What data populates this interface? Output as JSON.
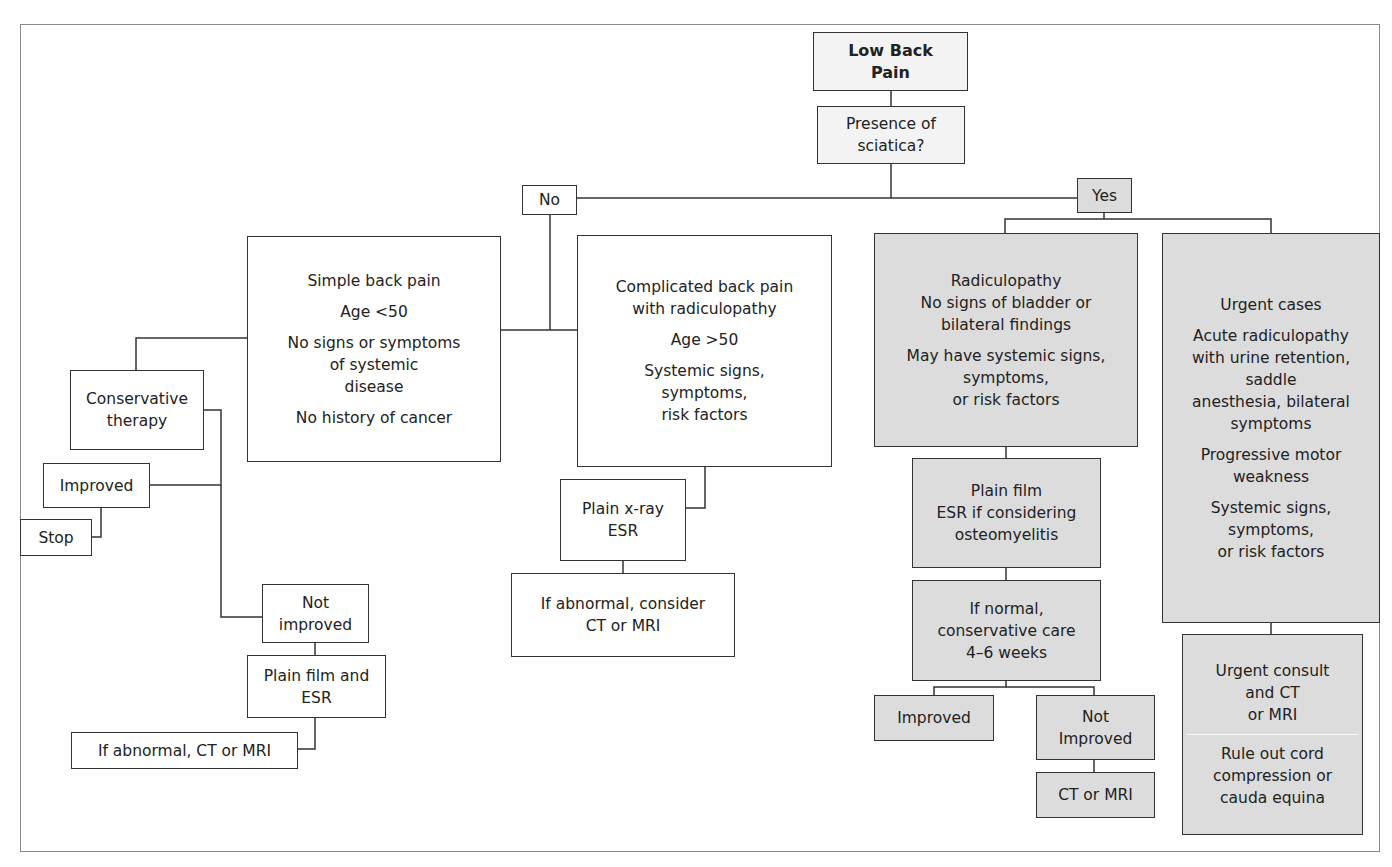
{
  "diagram": {
    "title": "Low Back Pain",
    "colors": {
      "outcome_gray": "#dcdcdc",
      "header_fill": "#f3f3f3",
      "line": "#333333",
      "frame": "#8a8a8a"
    },
    "nodes": {
      "root": {
        "lines": [
          "Low Back",
          "Pain"
        ]
      },
      "question": {
        "lines": [
          "Presence of",
          "sciatica?"
        ]
      },
      "no": {
        "label": "No"
      },
      "yes": {
        "label": "Yes"
      },
      "simple": {
        "title": "Simple back pain",
        "age": "Age <50",
        "criteria": [
          "No signs or symptoms",
          "of systemic",
          "disease"
        ],
        "history": "No history of cancer"
      },
      "conservative": {
        "lines": [
          "Conservative",
          "therapy"
        ]
      },
      "improved_left": {
        "label": "Improved"
      },
      "stop": {
        "label": "Stop"
      },
      "not_improved_left": {
        "lines": [
          "Not",
          "improved"
        ]
      },
      "plain_film_esr": {
        "lines": [
          "Plain film and",
          "ESR"
        ]
      },
      "if_abnormal_left": {
        "label": "If abnormal, CT or MRI"
      },
      "complicated": {
        "title": [
          "Complicated back pain",
          "with radiculopathy"
        ],
        "age": "Age >50",
        "criteria": [
          "Systemic signs,",
          "symptoms,",
          "risk factors"
        ]
      },
      "plain_xray": {
        "lines": [
          "Plain x-ray",
          "ESR"
        ]
      },
      "if_abnormal_consider": {
        "lines": [
          "If abnormal, consider",
          "CT or MRI"
        ]
      },
      "radiculopathy": {
        "title": [
          "Radiculopathy",
          "No signs of bladder or",
          "bilateral findings"
        ],
        "note": [
          "May have systemic signs,",
          "symptoms,",
          "or risk factors"
        ]
      },
      "plain_film_osteo": {
        "lines": [
          "Plain film",
          "ESR if considering",
          "osteomyelitis"
        ]
      },
      "if_normal": {
        "lines": [
          "If normal,",
          "conservative care",
          "4–6 weeks"
        ]
      },
      "improved_right": {
        "label": "Improved"
      },
      "not_improved_right": {
        "lines": [
          "Not",
          "Improved"
        ]
      },
      "ct_mri": {
        "label": "CT or MRI"
      },
      "urgent": {
        "title": "Urgent cases",
        "acute": [
          "Acute radiculopathy",
          "with urine retention,",
          "saddle",
          "anesthesia, bilateral",
          "symptoms"
        ],
        "motor": [
          "Progressive motor",
          "weakness"
        ],
        "systemic": [
          "Systemic signs,",
          "symptoms,",
          "or risk factors"
        ]
      },
      "urgent_consult": {
        "consult": [
          "Urgent consult",
          "and CT",
          "or MRI"
        ],
        "rule_out": [
          "Rule out cord",
          "compression or",
          "cauda equina"
        ]
      }
    }
  }
}
